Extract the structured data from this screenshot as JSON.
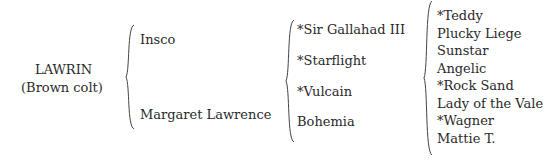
{
  "subject": {
    "name": "LAWRIN",
    "description": "(Brown colt)"
  },
  "parents": [
    "Insco",
    "Margaret Lawrence"
  ],
  "grandparents": [
    "*Sir Gallahad III",
    "*Starflight",
    "*Vulcain",
    "Bohemia"
  ],
  "great_grandparents": [
    "*Teddy",
    "Plucky Liege",
    "Sunstar",
    "Angelic",
    "*Rock Sand",
    "Lady of the Vale",
    "*Wagner",
    "Mattie T."
  ]
}
